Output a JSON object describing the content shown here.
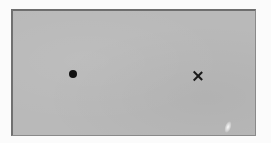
{
  "scene": {
    "description": "Gray card with a black dot on the left and an X mark on the right",
    "background_color": "#fbfbfb",
    "card_color": "#b9b9b9",
    "marks": [
      {
        "type": "dot",
        "name": "filled-circle",
        "color": "#111111",
        "x": 73,
        "y": 73
      },
      {
        "type": "cross",
        "name": "x-mark",
        "color": "#1a1a1a",
        "x": 197,
        "y": 74
      }
    ],
    "glare": {
      "x": 226,
      "y": 127
    }
  }
}
